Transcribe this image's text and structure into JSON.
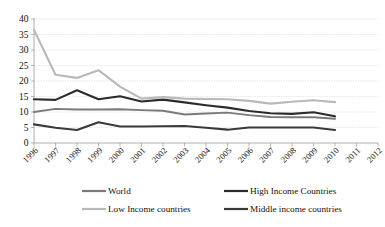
{
  "chart_data": {
    "type": "line",
    "title": "",
    "xlabel": "",
    "ylabel": "",
    "ylim": [
      0,
      40
    ],
    "ytick_step": 5,
    "yticks": [
      "0",
      "5",
      "10",
      "15",
      "20",
      "25",
      "30",
      "35",
      "40"
    ],
    "grid": true,
    "legend_position": "bottom",
    "categories": [
      "1996",
      "1997",
      "1998",
      "1999",
      "2000",
      "2001",
      "2002",
      "2003",
      "2004",
      "2005",
      "2006",
      "2007",
      "2008",
      "2009",
      "2010",
      "2011",
      "2012"
    ],
    "series": [
      {
        "name": "World",
        "color": "#7a7a7a",
        "values": [
          10.0,
          11.0,
          10.8,
          10.8,
          10.9,
          10.6,
          10.4,
          9.2,
          9.5,
          9.8,
          9.0,
          8.4,
          8.3,
          8.3,
          7.8,
          null,
          null
        ]
      },
      {
        "name": "High Income Countries",
        "color": "#2b2b2b",
        "values": [
          14.1,
          13.9,
          17.0,
          14.1,
          15.1,
          13.4,
          14.0,
          13.1,
          12.2,
          11.4,
          10.3,
          9.6,
          9.4,
          9.9,
          8.6,
          null,
          null
        ]
      },
      {
        "name": "Low Income countries",
        "color": "#b9b9b9",
        "values": [
          36.5,
          22.0,
          21.0,
          23.5,
          18.2,
          14.3,
          14.8,
          14.3,
          14.2,
          14.1,
          13.6,
          12.7,
          13.3,
          13.8,
          13.2,
          null,
          null
        ]
      },
      {
        "name": "Middle income countries",
        "color": "#3a3a3a",
        "values": [
          6.0,
          4.9,
          4.2,
          6.7,
          5.3,
          5.3,
          5.4,
          5.5,
          4.9,
          4.3,
          5.0,
          5.0,
          5.0,
          5.0,
          4.2,
          null,
          null
        ]
      }
    ]
  },
  "legend": {
    "entries": [
      {
        "label": "World",
        "color": "#7a7a7a"
      },
      {
        "label": "High Income Countries",
        "color": "#2b2b2b"
      },
      {
        "label": "Low Income countries",
        "color": "#b9b9b9"
      },
      {
        "label": "Middle income countries",
        "color": "#3a3a3a"
      }
    ]
  }
}
